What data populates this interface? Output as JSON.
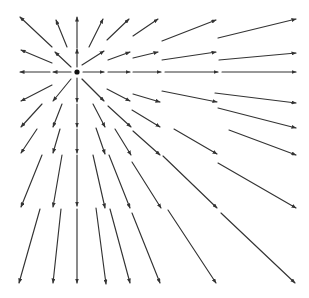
{
  "diagram": {
    "type": "vector-field",
    "line_color": "#333333",
    "source_color": "#111111",
    "source": {
      "x": 77,
      "y": 72,
      "r": 2.6
    },
    "arrows": [
      {
        "row": 1,
        "col": 1,
        "x1": 52,
        "y1": 47,
        "x2": 20,
        "y2": 17
      },
      {
        "row": 1,
        "col": 2,
        "x1": 67,
        "y1": 47,
        "x2": 56,
        "y2": 20
      },
      {
        "row": 1,
        "col": 3,
        "x1": 77,
        "y1": 48,
        "x2": 77,
        "y2": 17
      },
      {
        "row": 1,
        "col": 4,
        "x1": 89,
        "y1": 47,
        "x2": 103,
        "y2": 19
      },
      {
        "row": 1,
        "col": 5,
        "x1": 107,
        "y1": 40,
        "x2": 129,
        "y2": 19
      },
      {
        "row": 1,
        "col": 6,
        "x1": 133,
        "y1": 36,
        "x2": 158,
        "y2": 19
      },
      {
        "row": 1,
        "col": 7,
        "x1": 162,
        "y1": 41,
        "x2": 216,
        "y2": 20
      },
      {
        "row": 1,
        "col": 8,
        "x1": 218,
        "y1": 38,
        "x2": 296,
        "y2": 19
      },
      {
        "row": 2,
        "col": 1,
        "x1": 52,
        "y1": 63,
        "x2": 21,
        "y2": 50
      },
      {
        "row": 2,
        "col": 2,
        "x1": 71,
        "y1": 67,
        "x2": 55,
        "y2": 52
      },
      {
        "row": 2,
        "col": 3,
        "x1": 77,
        "y1": 67,
        "x2": 77,
        "y2": 49
      },
      {
        "row": 2,
        "col": 4,
        "x1": 82,
        "y1": 65,
        "x2": 104,
        "y2": 51
      },
      {
        "row": 2,
        "col": 5,
        "x1": 108,
        "y1": 60,
        "x2": 130,
        "y2": 52
      },
      {
        "row": 2,
        "col": 6,
        "x1": 133,
        "y1": 58,
        "x2": 158,
        "y2": 52
      },
      {
        "row": 2,
        "col": 7,
        "x1": 162,
        "y1": 60,
        "x2": 216,
        "y2": 52
      },
      {
        "row": 2,
        "col": 8,
        "x1": 219,
        "y1": 60,
        "x2": 296,
        "y2": 53
      },
      {
        "row": 3,
        "col": 1,
        "x1": 50,
        "y1": 72,
        "x2": 20,
        "y2": 72
      },
      {
        "row": 3,
        "col": 2,
        "x1": 71,
        "y1": 72,
        "x2": 53,
        "y2": 72
      },
      {
        "row": 3,
        "col": 4,
        "x1": 83,
        "y1": 72,
        "x2": 104,
        "y2": 72
      },
      {
        "row": 3,
        "col": 5,
        "x1": 108,
        "y1": 72,
        "x2": 130,
        "y2": 72
      },
      {
        "row": 3,
        "col": 6,
        "x1": 133,
        "y1": 72,
        "x2": 161,
        "y2": 72
      },
      {
        "row": 3,
        "col": 7,
        "x1": 165,
        "y1": 72,
        "x2": 218,
        "y2": 72
      },
      {
        "row": 3,
        "col": 8,
        "x1": 222,
        "y1": 72,
        "x2": 296,
        "y2": 72
      },
      {
        "row": 4,
        "col": 1,
        "x1": 52,
        "y1": 85,
        "x2": 21,
        "y2": 101
      },
      {
        "row": 4,
        "col": 2,
        "x1": 71,
        "y1": 79,
        "x2": 53,
        "y2": 101
      },
      {
        "row": 4,
        "col": 3,
        "x1": 77,
        "y1": 78,
        "x2": 77,
        "y2": 102
      },
      {
        "row": 4,
        "col": 4,
        "x1": 82,
        "y1": 79,
        "x2": 104,
        "y2": 101
      },
      {
        "row": 4,
        "col": 5,
        "x1": 107,
        "y1": 89,
        "x2": 130,
        "y2": 101
      },
      {
        "row": 4,
        "col": 6,
        "x1": 133,
        "y1": 94,
        "x2": 160,
        "y2": 102
      },
      {
        "row": 4,
        "col": 7,
        "x1": 162,
        "y1": 91,
        "x2": 217,
        "y2": 102
      },
      {
        "row": 4,
        "col": 8,
        "x1": 215,
        "y1": 93,
        "x2": 296,
        "y2": 103
      },
      {
        "row": 5,
        "col": 1,
        "x1": 42,
        "y1": 104,
        "x2": 21,
        "y2": 127
      },
      {
        "row": 5,
        "col": 2,
        "x1": 62,
        "y1": 104,
        "x2": 53,
        "y2": 127
      },
      {
        "row": 5,
        "col": 3,
        "x1": 77,
        "y1": 104,
        "x2": 77,
        "y2": 127
      },
      {
        "row": 5,
        "col": 4,
        "x1": 93,
        "y1": 104,
        "x2": 105,
        "y2": 127
      },
      {
        "row": 5,
        "col": 5,
        "x1": 108,
        "y1": 106,
        "x2": 131,
        "y2": 127
      },
      {
        "row": 5,
        "col": 6,
        "x1": 132,
        "y1": 110,
        "x2": 160,
        "y2": 127
      },
      {
        "row": 5,
        "col": 8,
        "x1": 218,
        "y1": 108,
        "x2": 296,
        "y2": 128
      },
      {
        "row": 6,
        "col": 1,
        "x1": 37,
        "y1": 129,
        "x2": 21,
        "y2": 153
      },
      {
        "row": 6,
        "col": 2,
        "x1": 60,
        "y1": 129,
        "x2": 53,
        "y2": 153
      },
      {
        "row": 6,
        "col": 3,
        "x1": 77,
        "y1": 129,
        "x2": 77,
        "y2": 153
      },
      {
        "row": 6,
        "col": 4,
        "x1": 96,
        "y1": 128,
        "x2": 105,
        "y2": 154
      },
      {
        "row": 6,
        "col": 5,
        "x1": 115,
        "y1": 129,
        "x2": 131,
        "y2": 155
      },
      {
        "row": 6,
        "col": 6,
        "x1": 133,
        "y1": 131,
        "x2": 160,
        "y2": 155
      },
      {
        "row": 6,
        "col": 7,
        "x1": 174,
        "y1": 129,
        "x2": 217,
        "y2": 154
      },
      {
        "row": 6,
        "col": 8,
        "x1": 229,
        "y1": 130,
        "x2": 296,
        "y2": 155
      },
      {
        "row": 7,
        "col": 1,
        "x1": 42,
        "y1": 155,
        "x2": 21,
        "y2": 207
      },
      {
        "row": 7,
        "col": 2,
        "x1": 62,
        "y1": 155,
        "x2": 53,
        "y2": 207
      },
      {
        "row": 7,
        "col": 3,
        "x1": 77,
        "y1": 155,
        "x2": 77,
        "y2": 206
      },
      {
        "row": 7,
        "col": 4,
        "x1": 93,
        "y1": 155,
        "x2": 105,
        "y2": 208
      },
      {
        "row": 7,
        "col": 5,
        "x1": 109,
        "y1": 155,
        "x2": 130,
        "y2": 208
      },
      {
        "row": 7,
        "col": 6,
        "x1": 132,
        "y1": 162,
        "x2": 161,
        "y2": 208
      },
      {
        "row": 7,
        "col": 7,
        "x1": 163,
        "y1": 156,
        "x2": 217,
        "y2": 208
      },
      {
        "row": 7,
        "col": 8,
        "x1": 218,
        "y1": 163,
        "x2": 296,
        "y2": 208
      },
      {
        "row": 8,
        "col": 1,
        "x1": 40,
        "y1": 209,
        "x2": 19,
        "y2": 283
      },
      {
        "row": 8,
        "col": 2,
        "x1": 61,
        "y1": 209,
        "x2": 53,
        "y2": 283
      },
      {
        "row": 8,
        "col": 3,
        "x1": 77,
        "y1": 209,
        "x2": 77,
        "y2": 283
      },
      {
        "row": 8,
        "col": 4,
        "x1": 96,
        "y1": 208,
        "x2": 106,
        "y2": 284
      },
      {
        "row": 8,
        "col": 5,
        "x1": 110,
        "y1": 209,
        "x2": 130,
        "y2": 283
      },
      {
        "row": 8,
        "col": 6,
        "x1": 132,
        "y1": 213,
        "x2": 160,
        "y2": 283
      },
      {
        "row": 8,
        "col": 7,
        "x1": 168,
        "y1": 210,
        "x2": 216,
        "y2": 283
      },
      {
        "row": 8,
        "col": 8,
        "x1": 221,
        "y1": 213,
        "x2": 295,
        "y2": 283
      }
    ]
  }
}
